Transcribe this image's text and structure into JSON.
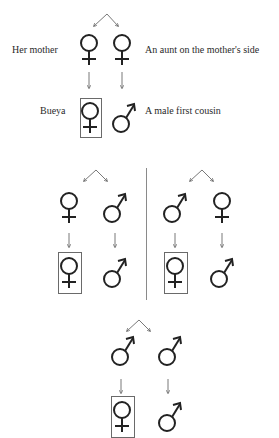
{
  "diagram": {
    "type": "kinship-chart",
    "colors": {
      "stroke": "#222222",
      "box": "#6a6a6a",
      "divider": "#8a8a8a",
      "arrow": "#555555"
    },
    "section1": {
      "parents": [
        {
          "symbol": "female",
          "label": "Her mother"
        },
        {
          "symbol": "female",
          "label": "An aunt on the mother's side"
        }
      ],
      "children": [
        {
          "symbol": "female",
          "label": "Bueya",
          "boxed": true
        },
        {
          "symbol": "male",
          "label": "A male first cousin",
          "boxed": false
        }
      ]
    },
    "section2_left": {
      "parents": [
        {
          "symbol": "female"
        },
        {
          "symbol": "male"
        }
      ],
      "children": [
        {
          "symbol": "female",
          "boxed": true
        },
        {
          "symbol": "male",
          "boxed": false
        }
      ]
    },
    "section2_right": {
      "parents": [
        {
          "symbol": "male"
        },
        {
          "symbol": "female"
        }
      ],
      "children": [
        {
          "symbol": "female",
          "boxed": true
        },
        {
          "symbol": "male",
          "boxed": false
        }
      ]
    },
    "section3": {
      "parents": [
        {
          "symbol": "male"
        },
        {
          "symbol": "male"
        }
      ],
      "children": [
        {
          "symbol": "female",
          "boxed": true
        },
        {
          "symbol": "male",
          "boxed": false
        }
      ]
    }
  }
}
